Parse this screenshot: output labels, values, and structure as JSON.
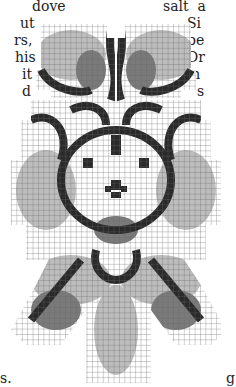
{
  "page": {
    "left_text_lines": [
      "dove",
      "ut",
      "rs,",
      "his",
      "it",
      "d"
    ],
    "left_text_bottom": "s.",
    "right_text_lines": [
      "salt  a",
      "Si",
      "be",
      "Dr",
      "m",
      "s"
    ],
    "right_text_bottom": "g"
  },
  "chart": {
    "cell_size": 5.4,
    "grid_color": "#555555",
    "ink_dark": "#2a2a2a",
    "ink_mid": "#7a7a7a",
    "ink_light": "#bdbdbd"
  }
}
